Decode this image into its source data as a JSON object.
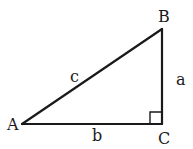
{
  "diagram": {
    "type": "right-triangle",
    "vertices": [
      {
        "id": "A",
        "label": "A",
        "x": 22,
        "y": 124
      },
      {
        "id": "B",
        "label": "B",
        "x": 162,
        "y": 29
      },
      {
        "id": "C",
        "label": "C",
        "x": 162,
        "y": 124
      }
    ],
    "sides": [
      {
        "id": "a",
        "label": "a",
        "from": "B",
        "to": "C"
      },
      {
        "id": "b",
        "label": "b",
        "from": "A",
        "to": "C"
      },
      {
        "id": "c",
        "label": "c",
        "from": "A",
        "to": "B"
      }
    ],
    "right_angle_at": "C",
    "colors": {
      "stroke": "#1a1a1a",
      "background": "#ffffff"
    }
  }
}
